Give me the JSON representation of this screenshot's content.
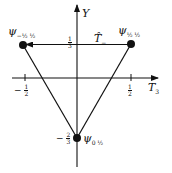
{
  "diagram": {
    "axes": {
      "x_label": "T",
      "x_label_sub": "3",
      "y_label": "Y"
    },
    "ticks": {
      "x_neg": {
        "sign": "−",
        "num": "1",
        "den": "2"
      },
      "x_pos": {
        "num": "1",
        "den": "2"
      },
      "y_pos": {
        "num": "1",
        "den": "3"
      },
      "y_neg": {
        "sign": "−",
        "num": "2",
        "den": "3"
      }
    },
    "states": [
      {
        "name": "ψ",
        "label_sub": "−½ ½",
        "t3": "-1/2",
        "y": "1/3"
      },
      {
        "name": "ψ",
        "label_sub": "½ ½",
        "t3": "1/2",
        "y": "1/3"
      },
      {
        "name": "ψ",
        "label_sub": "0 ½",
        "t3": "0",
        "y": "-2/3"
      }
    ],
    "operator": {
      "label": "T̂",
      "sub": "−"
    },
    "colors": {
      "ink": "#111111",
      "background": "#ffffff"
    }
  }
}
